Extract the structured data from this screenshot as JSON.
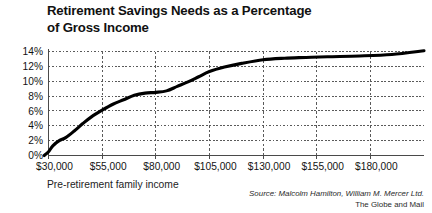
{
  "figure": {
    "title": "Retirement Savings Needs as a Percentage of Gross Income",
    "title_line_1": "Retirement Savings Needs as a Percentage",
    "title_line_2": "of Gross Income",
    "axis_caption": "Pre-retirement family income",
    "source_line_1": "Source: Malcolm Hamilton, William M. Mercer Ltd.",
    "source_line_2": "The Globe and Mail",
    "line_color": "#000000",
    "grid_color": "#5a5a5a",
    "axis_color": "#4a4a4a",
    "background": "#ffffff"
  },
  "chart_data": {
    "type": "line",
    "title": "Retirement Savings Needs as a Percentage of Gross Income",
    "xlabel": "Pre-retirement family income",
    "ylabel": "",
    "xlim": [
      30000,
      205000
    ],
    "ylim": [
      0,
      14
    ],
    "grid": true,
    "grid_style": "dotted",
    "legend": "none",
    "x_tick_labels": [
      "$30,000",
      "$55,000",
      "$80,000",
      "$105,000",
      "$130,000",
      "$155,000",
      "$180,000"
    ],
    "x_tick_values": [
      30000,
      55000,
      80000,
      105000,
      130000,
      155000,
      180000
    ],
    "y_tick_labels": [
      "0%",
      "2%",
      "4%",
      "6%",
      "8%",
      "10%",
      "12%",
      "14%"
    ],
    "y_tick_values": [
      0,
      2,
      4,
      6,
      8,
      10,
      12,
      14
    ],
    "series": [
      {
        "name": "Retirement savings needs",
        "x": [
          28000,
          30000,
          32000,
          35000,
          38000,
          42000,
          46000,
          50000,
          55000,
          60000,
          65000,
          70000,
          75000,
          80000,
          85000,
          90000,
          95000,
          100000,
          105000,
          112000,
          120000,
          130000,
          140000,
          150000,
          160000,
          175000,
          190000,
          205000
        ],
        "values": [
          0.0,
          0.5,
          1.3,
          2.0,
          2.4,
          3.3,
          4.3,
          5.2,
          6.1,
          6.9,
          7.5,
          8.1,
          8.4,
          8.5,
          8.7,
          9.3,
          9.9,
          10.6,
          11.3,
          11.9,
          12.4,
          12.9,
          13.1,
          13.2,
          13.3,
          13.4,
          13.6,
          14.1
        ]
      }
    ]
  }
}
